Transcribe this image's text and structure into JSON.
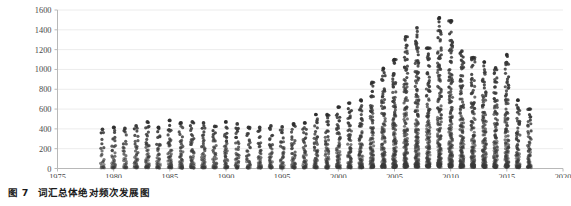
{
  "caption": {
    "label": "图 7",
    "text": "词汇总体绝对频次发展图"
  },
  "chart_data": {
    "type": "scatter",
    "title": "",
    "subtitle": "",
    "xlabel": "",
    "ylabel": "",
    "xlim": [
      1975,
      2020
    ],
    "ylim": [
      0,
      1600
    ],
    "grid": true,
    "grid_axis": "y",
    "legend": null,
    "legend_position": "none",
    "xticks": [
      1975,
      1980,
      1985,
      1990,
      1995,
      2000,
      2005,
      2010,
      2015,
      2020
    ],
    "xtick_labels": [
      "1975",
      "1980",
      "1985",
      "1990",
      "1995",
      "2000",
      "2005",
      "2010",
      "2015",
      "2020"
    ],
    "yticks": [
      0,
      200,
      400,
      600,
      800,
      1000,
      1200,
      1400,
      1600
    ],
    "ytick_labels": [
      "0",
      "200",
      "400",
      "600",
      "800",
      "1000",
      "1200",
      "1400",
      "1600"
    ],
    "point_color": "#3a3a3a",
    "point_size": 1.6,
    "series": [
      {
        "name": "词汇绝对频次",
        "x": [
          1979,
          1980,
          1981,
          1982,
          1983,
          1984,
          1985,
          1986,
          1987,
          1988,
          1989,
          1990,
          1991,
          1992,
          1993,
          1994,
          1995,
          1996,
          1997,
          1998,
          1999,
          2000,
          2001,
          2002,
          2003,
          2004,
          2005,
          2006,
          2007,
          2008,
          2009,
          2010,
          2011,
          2012,
          2013,
          2014,
          2015,
          2016,
          2017
        ],
        "max_values": [
          395,
          415,
          405,
          430,
          470,
          415,
          485,
          460,
          470,
          460,
          425,
          470,
          450,
          415,
          415,
          430,
          420,
          450,
          460,
          545,
          545,
          620,
          660,
          690,
          870,
          1010,
          1100,
          1330,
          1420,
          1215,
          1520,
          1490,
          1185,
          1120,
          1075,
          1015,
          1150,
          690,
          600
        ],
        "median_values": [
          120,
          130,
          125,
          135,
          150,
          140,
          155,
          150,
          150,
          145,
          140,
          150,
          145,
          140,
          135,
          140,
          135,
          145,
          150,
          170,
          175,
          190,
          200,
          215,
          255,
          290,
          320,
          370,
          400,
          360,
          430,
          420,
          350,
          330,
          315,
          300,
          330,
          215,
          185
        ],
        "counts": [
          22,
          34,
          30,
          38,
          46,
          40,
          50,
          46,
          48,
          44,
          40,
          48,
          44,
          40,
          38,
          42,
          40,
          46,
          48,
          58,
          60,
          70,
          76,
          84,
          100,
          118,
          132,
          150,
          162,
          142,
          176,
          170,
          140,
          130,
          124,
          116,
          128,
          80,
          62
        ]
      }
    ]
  }
}
